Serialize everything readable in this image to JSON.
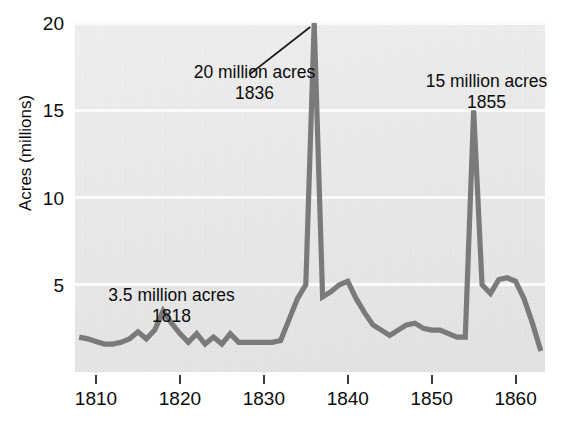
{
  "chart_data": {
    "type": "line",
    "title": "",
    "xlabel": "",
    "ylabel": "Acres (millions)",
    "xlim": [
      1807.5,
      1863.5
    ],
    "ylim": [
      0,
      20
    ],
    "grid": true,
    "legend": false,
    "series_color": "#7a7a7a",
    "plot_background": "#ececec",
    "gridline_color": "#fbfbfb",
    "x_ticks": [
      1810,
      1820,
      1830,
      1840,
      1850,
      1860
    ],
    "y_ticks": [
      5,
      10,
      15,
      20
    ],
    "x": [
      1808,
      1809,
      1810,
      1811,
      1812,
      1813,
      1814,
      1815,
      1816,
      1817,
      1818,
      1819,
      1820,
      1821,
      1822,
      1823,
      1824,
      1825,
      1826,
      1827,
      1828,
      1829,
      1830,
      1831,
      1832,
      1833,
      1834,
      1835,
      1836,
      1837,
      1838,
      1839,
      1840,
      1841,
      1842,
      1843,
      1844,
      1845,
      1846,
      1847,
      1848,
      1849,
      1850,
      1851,
      1852,
      1853,
      1854,
      1855,
      1856,
      1857,
      1858,
      1859,
      1860,
      1861,
      1862,
      1863
    ],
    "values": [
      2.0,
      1.9,
      1.75,
      1.6,
      1.6,
      1.7,
      1.9,
      2.3,
      1.9,
      2.4,
      3.5,
      2.8,
      2.2,
      1.7,
      2.2,
      1.6,
      2.0,
      1.6,
      2.2,
      1.7,
      1.7,
      1.7,
      1.7,
      1.7,
      1.8,
      3.0,
      4.2,
      5.0,
      20.0,
      4.3,
      4.6,
      5.0,
      5.2,
      4.2,
      3.4,
      2.7,
      2.4,
      2.1,
      2.4,
      2.7,
      2.8,
      2.5,
      2.4,
      2.4,
      2.2,
      2.0,
      2.0,
      15.0,
      5.0,
      4.5,
      5.3,
      5.4,
      5.2,
      4.2,
      2.8,
      1.2
    ],
    "annotations": [
      {
        "id": "ann-1836",
        "line1": "20 million acres",
        "line2": "1836",
        "points_to_x": 1836,
        "points_to_y": 20,
        "has_leader_line": true
      },
      {
        "id": "ann-1855",
        "line1": "15 million acres",
        "line2": "1855",
        "points_to_x": 1855,
        "points_to_y": 15,
        "has_leader_line": false
      },
      {
        "id": "ann-1818",
        "line1": "3.5 million acres",
        "line2": "1818",
        "points_to_x": 1818,
        "points_to_y": 3.5,
        "has_leader_line": false
      }
    ]
  },
  "axes": {
    "y_title": "Acres (millions)",
    "y_tick_labels": [
      "20",
      "15",
      "10",
      "5"
    ],
    "x_tick_labels": [
      "1810",
      "1820",
      "1830",
      "1840",
      "1850",
      "1860"
    ]
  }
}
